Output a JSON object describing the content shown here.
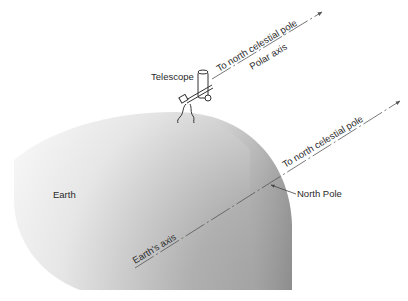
{
  "figure": {
    "labels": {
      "telescope": "Telescope",
      "polar_to_pole": "To north celestial pole",
      "polar_axis": "Polar axis",
      "earth_to_pole": "To north celestial pole",
      "north_pole": "North Pole",
      "earth": "Earth",
      "earths_axis": "Earth's axis"
    },
    "colors": {
      "earth_dark": "#8a8a8a",
      "earth_light": "#f2f2f2",
      "line": "#555555",
      "text": "#2a2a2a"
    }
  }
}
